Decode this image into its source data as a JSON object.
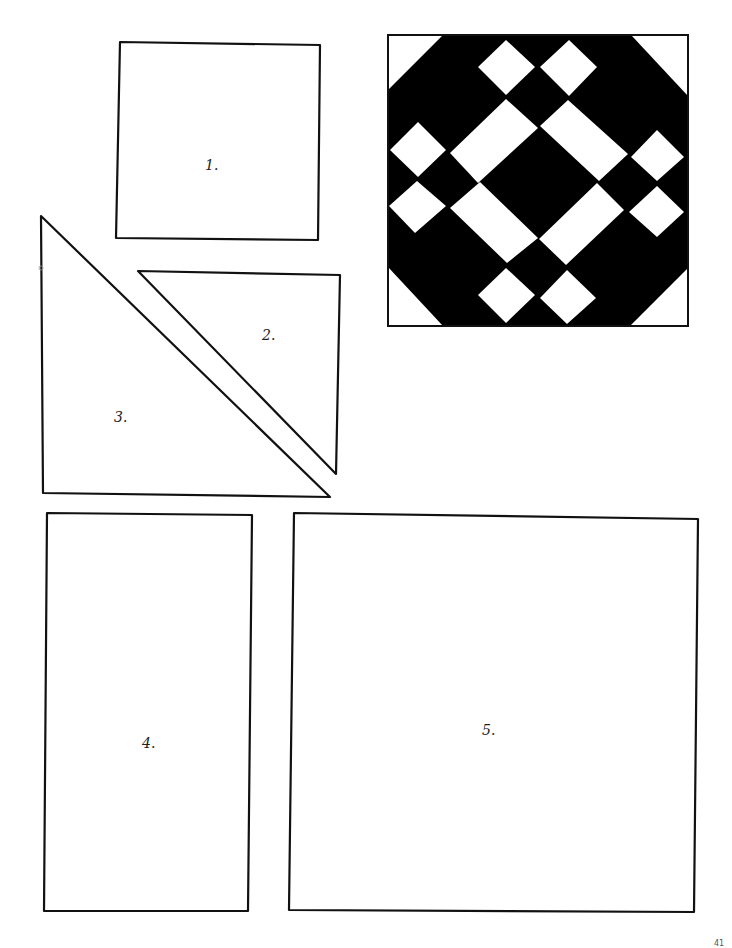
{
  "page": {
    "page_number": "41",
    "ink_color": "#111111",
    "paper_color": "#ffffff"
  },
  "pieces": [
    {
      "id": 1,
      "label": "1.",
      "shape": "square"
    },
    {
      "id": 2,
      "label": "2.",
      "shape": "right-triangle (small)"
    },
    {
      "id": 3,
      "label": "3.",
      "shape": "right-triangle (large)"
    },
    {
      "id": 4,
      "label": "4.",
      "shape": "rectangle"
    },
    {
      "id": 5,
      "label": "5.",
      "shape": "large square"
    }
  ],
  "block_preview": {
    "name": "Quilt block diagram",
    "dark_color": "#000000",
    "light_color": "#ffffff"
  }
}
